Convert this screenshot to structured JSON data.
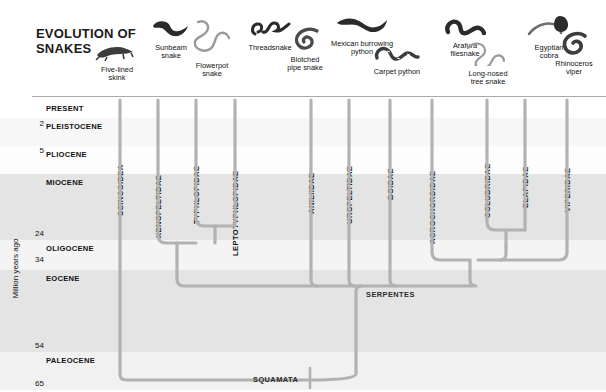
{
  "title": "EVOLUTION OF\nSNAKES",
  "axis": {
    "name": "Million years ago",
    "unit": "million years ago",
    "ticks": [
      {
        "value": "2",
        "y": 28
      },
      {
        "value": "5",
        "y": 55
      },
      {
        "value": "24",
        "y": 138
      },
      {
        "value": "34",
        "y": 164
      },
      {
        "value": "54",
        "y": 250
      },
      {
        "value": "65",
        "y": 288
      }
    ],
    "epochs": [
      {
        "label": "PRESENT",
        "y": 4,
        "height": 18,
        "shade": "#ffffff"
      },
      {
        "label": "PLEISTOCENE",
        "y": 22,
        "height": 28,
        "shade": "#f7f7f7"
      },
      {
        "label": "PLIOCENE",
        "y": 50,
        "height": 28,
        "shade": "#fdfdfd"
      },
      {
        "label": "MIOCENE",
        "y": 78,
        "height": 66,
        "shade": "#e4e4e4"
      },
      {
        "label": "OLIGOCENE",
        "y": 144,
        "height": 30,
        "shade": "#f4f4f4"
      },
      {
        "label": "EOCENE",
        "y": 174,
        "height": 82,
        "shade": "#e4e4e4"
      },
      {
        "label": "PALEOCENE",
        "y": 256,
        "height": 38,
        "shade": "#f1f1f1"
      }
    ]
  },
  "taxa": [
    {
      "name": "SCINCOIDEA",
      "x": 120,
      "label_y": 120
    },
    {
      "name": "XENOPELTIDAE",
      "x": 158,
      "label_y": 142
    },
    {
      "name": "TYPHLOPIDAE",
      "x": 196,
      "label_y": 128
    },
    {
      "name": "LEPTOTYPHLOPIDAE",
      "x": 235,
      "label_y": 160
    },
    {
      "name": "ANILIIDAE",
      "x": 311,
      "label_y": 118
    },
    {
      "name": "UROPELTIDAE",
      "x": 349,
      "label_y": 128
    },
    {
      "name": "BOIDAE",
      "x": 390,
      "label_y": 104
    },
    {
      "name": "ACROCHORDIDAE",
      "x": 432,
      "label_y": 148
    },
    {
      "name": "COLUBRIDAE",
      "x": 487,
      "label_y": 122
    },
    {
      "name": "ELAPIDAE",
      "x": 525,
      "label_y": 112
    },
    {
      "name": "VIPERIDAE",
      "x": 567,
      "label_y": 116
    }
  ],
  "clades": [
    {
      "name": "SERPENTES",
      "x": 366,
      "y": 194
    },
    {
      "name": "SQUAMATA",
      "x": 253,
      "y": 279
    }
  ],
  "specimens": [
    {
      "name": "Five-lined\nskink",
      "icon": "skink-icon",
      "x": 84,
      "y": 42,
      "w": 66
    },
    {
      "name": "Sunbeam\nsnake",
      "icon": "sunbeam-snake-icon",
      "x": 140,
      "y": 18,
      "w": 62
    },
    {
      "name": "Flowerpot\nsnake",
      "icon": "flowerpot-snake-icon",
      "x": 176,
      "y": 18,
      "w": 72
    },
    {
      "name": "Threadsnake",
      "icon": "threadsnake-icon",
      "x": 232,
      "y": 14,
      "w": 76
    },
    {
      "name": "Blotched\npipe snake",
      "icon": "pipe-snake-icon",
      "x": 272,
      "y": 26,
      "w": 66
    },
    {
      "name": "Mexican burrowing\npython",
      "icon": "burrowing-python-icon",
      "x": 310,
      "y": 14,
      "w": 104
    },
    {
      "name": "Carpet python",
      "icon": "carpet-python-icon",
      "x": 356,
      "y": 42,
      "w": 82
    },
    {
      "name": "Arafura\nfilesnake",
      "icon": "filesnake-icon",
      "x": 432,
      "y": 12,
      "w": 66
    },
    {
      "name": "Long-nosed\ntree snake",
      "icon": "tree-snake-icon",
      "x": 452,
      "y": 38,
      "w": 72
    },
    {
      "name": "Egyptian\ncobra",
      "icon": "cobra-icon",
      "x": 518,
      "y": 12,
      "w": 62
    },
    {
      "name": "Rhinoceros\nviper",
      "icon": "viper-icon",
      "x": 542,
      "y": 30,
      "w": 64
    }
  ],
  "colors": {
    "branch": "#b2b2b2",
    "band_light": "#f6f6f6",
    "band_dark": "#e4e4e4",
    "text": "#111111"
  }
}
